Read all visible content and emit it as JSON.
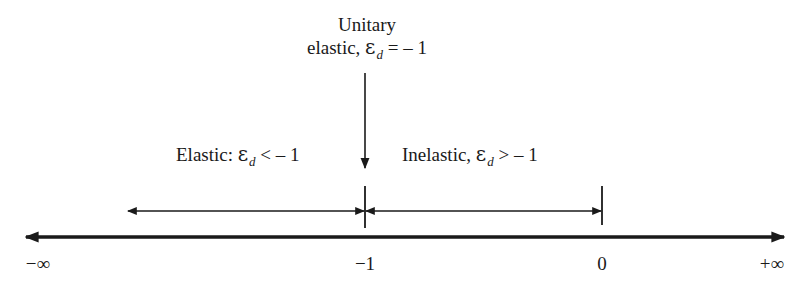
{
  "diagram": {
    "unitary": {
      "line1": "Unitary",
      "line2_prefix": "elastic, ",
      "symbol": "ε",
      "subscript": "d",
      "relation": " = – 1"
    },
    "elastic": {
      "prefix": "Elastic: ",
      "symbol": "ε",
      "subscript": "d",
      "relation": " < – 1"
    },
    "inelastic": {
      "prefix": "Inelastic, ",
      "symbol": "ε",
      "subscript": "d",
      "relation": " > – 1"
    },
    "axis": {
      "ticks": [
        {
          "label": "−∞",
          "x": 38
        },
        {
          "label": "−1",
          "x": 365
        },
        {
          "label": "0",
          "x": 602
        },
        {
          "label": "+∞",
          "x": 772
        }
      ]
    },
    "colors": {
      "line": "#1a1a1a",
      "background": "#ffffff"
    }
  }
}
